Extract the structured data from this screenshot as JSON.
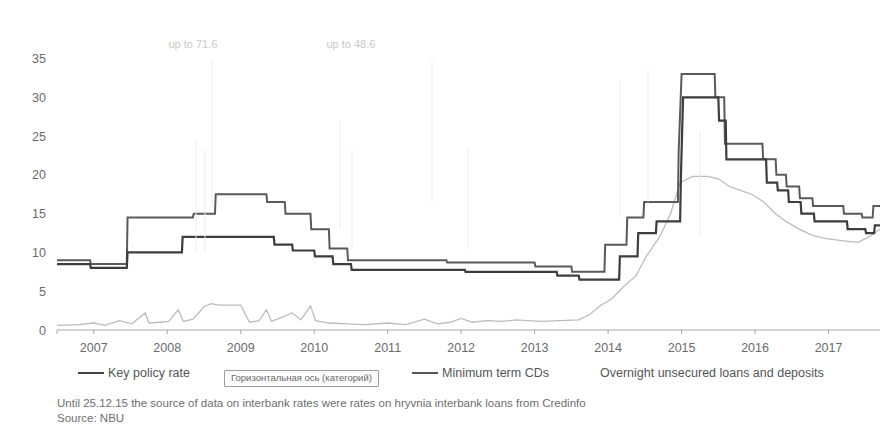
{
  "chart_data": {
    "type": "line",
    "title": "",
    "xlabel": "",
    "ylabel": "",
    "xlim": [
      2006.6,
      2017.8
    ],
    "ylim": [
      0,
      37
    ],
    "yticks": [
      0,
      5,
      10,
      15,
      20,
      25,
      30,
      35
    ],
    "xticks": [
      "2007",
      "2008",
      "2009",
      "2010",
      "2011",
      "2012",
      "2013",
      "2014",
      "2015",
      "2016",
      "2017"
    ],
    "grid": false,
    "legend_position": "bottom",
    "annotations": [
      {
        "text": "up to 71.6",
        "x": 2008.45,
        "y": 36.3
      },
      {
        "text": "up to 48.6",
        "x": 2010.6,
        "y": 36.3
      }
    ],
    "series": [
      {
        "name": "Key policy rate",
        "color": "#3d3d3d",
        "style": "step",
        "width": 2.2,
        "points": [
          [
            2006.6,
            8.5
          ],
          [
            2007.05,
            8.5
          ],
          [
            2007.06,
            8.0
          ],
          [
            2007.55,
            8.0
          ],
          [
            2007.56,
            10.0
          ],
          [
            2008.3,
            10.0
          ],
          [
            2008.31,
            12.0
          ],
          [
            2008.95,
            12.0
          ],
          [
            2008.96,
            12.0
          ],
          [
            2009.55,
            12.0
          ],
          [
            2009.56,
            11.0
          ],
          [
            2009.8,
            11.0
          ],
          [
            2009.81,
            10.25
          ],
          [
            2010.1,
            10.25
          ],
          [
            2010.11,
            9.5
          ],
          [
            2010.35,
            9.5
          ],
          [
            2010.36,
            8.5
          ],
          [
            2010.6,
            8.5
          ],
          [
            2010.61,
            7.75
          ],
          [
            2012.15,
            7.75
          ],
          [
            2012.16,
            7.5
          ],
          [
            2013.4,
            7.5
          ],
          [
            2013.41,
            7.0
          ],
          [
            2013.7,
            7.0
          ],
          [
            2013.71,
            6.5
          ],
          [
            2014.25,
            6.5
          ],
          [
            2014.26,
            9.5
          ],
          [
            2014.5,
            9.5
          ],
          [
            2014.51,
            12.5
          ],
          [
            2014.75,
            12.5
          ],
          [
            2014.76,
            14.0
          ],
          [
            2015.08,
            14.0
          ],
          [
            2015.09,
            19.5
          ],
          [
            2015.12,
            30.0
          ],
          [
            2015.6,
            30.0
          ],
          [
            2015.61,
            27.0
          ],
          [
            2015.7,
            27.0
          ],
          [
            2015.71,
            22.0
          ],
          [
            2016.25,
            22.0
          ],
          [
            2016.26,
            19.0
          ],
          [
            2016.4,
            19.0
          ],
          [
            2016.41,
            18.0
          ],
          [
            2016.55,
            18.0
          ],
          [
            2016.56,
            16.5
          ],
          [
            2016.72,
            16.5
          ],
          [
            2016.73,
            15.0
          ],
          [
            2016.9,
            15.0
          ],
          [
            2016.91,
            14.0
          ],
          [
            2017.35,
            14.0
          ],
          [
            2017.36,
            13.0
          ],
          [
            2017.6,
            13.0
          ],
          [
            2017.61,
            12.5
          ],
          [
            2017.72,
            12.5
          ],
          [
            2017.73,
            13.5
          ],
          [
            2017.8,
            13.5
          ]
        ]
      },
      {
        "name": "Minimum term CDs",
        "color": "#5a5a5a",
        "style": "step-upper",
        "width": 2.0,
        "points": [
          [
            2006.6,
            9.0
          ],
          [
            2007.05,
            9.0
          ],
          [
            2007.06,
            8.5
          ],
          [
            2007.55,
            8.5
          ],
          [
            2007.56,
            14.5
          ],
          [
            2008.45,
            14.5
          ],
          [
            2008.46,
            15.0
          ],
          [
            2008.75,
            15.0
          ],
          [
            2008.76,
            17.5
          ],
          [
            2009.45,
            17.5
          ],
          [
            2009.46,
            16.5
          ],
          [
            2009.7,
            16.5
          ],
          [
            2009.71,
            15.0
          ],
          [
            2010.05,
            15.0
          ],
          [
            2010.06,
            13.0
          ],
          [
            2010.3,
            13.0
          ],
          [
            2010.31,
            10.5
          ],
          [
            2010.55,
            10.5
          ],
          [
            2010.56,
            9.0
          ],
          [
            2011.9,
            9.0
          ],
          [
            2011.91,
            8.7
          ],
          [
            2013.1,
            8.7
          ],
          [
            2013.11,
            8.2
          ],
          [
            2013.6,
            8.2
          ],
          [
            2013.61,
            7.5
          ],
          [
            2014.05,
            7.5
          ],
          [
            2014.06,
            11.0
          ],
          [
            2014.35,
            11.0
          ],
          [
            2014.36,
            14.5
          ],
          [
            2014.58,
            14.5
          ],
          [
            2014.59,
            16.5
          ],
          [
            2015.05,
            16.5
          ],
          [
            2015.06,
            23.0
          ],
          [
            2015.1,
            33.0
          ],
          [
            2015.55,
            33.0
          ],
          [
            2015.56,
            30.0
          ],
          [
            2015.68,
            30.0
          ],
          [
            2015.69,
            24.0
          ],
          [
            2016.2,
            24.0
          ],
          [
            2016.21,
            22.0
          ],
          [
            2016.38,
            22.0
          ],
          [
            2016.39,
            20.0
          ],
          [
            2016.52,
            20.0
          ],
          [
            2016.53,
            18.5
          ],
          [
            2016.7,
            18.5
          ],
          [
            2016.71,
            17.0
          ],
          [
            2016.88,
            17.0
          ],
          [
            2016.89,
            16.0
          ],
          [
            2017.3,
            16.0
          ],
          [
            2017.31,
            15.0
          ],
          [
            2017.55,
            15.0
          ],
          [
            2017.56,
            14.5
          ],
          [
            2017.7,
            14.5
          ],
          [
            2017.71,
            16.0
          ],
          [
            2017.8,
            16.0
          ]
        ]
      },
      {
        "name": "Overnight unsecured loans and deposits",
        "color": "#bcbcbc",
        "style": "noisy",
        "width": 1.3,
        "points": [
          [
            2006.6,
            0.6
          ],
          [
            2006.9,
            0.7
          ],
          [
            2007.1,
            0.9
          ],
          [
            2007.25,
            0.6
          ],
          [
            2007.45,
            1.2
          ],
          [
            2007.62,
            0.8
          ],
          [
            2007.8,
            2.2
          ],
          [
            2007.85,
            0.9
          ],
          [
            2008.0,
            1.0
          ],
          [
            2008.12,
            1.1
          ],
          [
            2008.25,
            2.6
          ],
          [
            2008.32,
            1.1
          ],
          [
            2008.45,
            1.4
          ],
          [
            2008.6,
            3.0
          ],
          [
            2008.7,
            3.4
          ],
          [
            2008.8,
            3.2
          ],
          [
            2008.95,
            3.2
          ],
          [
            2009.1,
            3.2
          ],
          [
            2009.22,
            1.0
          ],
          [
            2009.35,
            1.2
          ],
          [
            2009.45,
            2.6
          ],
          [
            2009.52,
            1.1
          ],
          [
            2009.65,
            1.6
          ],
          [
            2009.8,
            2.2
          ],
          [
            2009.92,
            1.3
          ],
          [
            2010.05,
            3.1
          ],
          [
            2010.12,
            1.2
          ],
          [
            2010.3,
            0.9
          ],
          [
            2010.55,
            0.8
          ],
          [
            2010.8,
            0.7
          ],
          [
            2011.1,
            0.9
          ],
          [
            2011.35,
            0.7
          ],
          [
            2011.6,
            1.4
          ],
          [
            2011.78,
            0.8
          ],
          [
            2011.95,
            1.0
          ],
          [
            2012.1,
            1.5
          ],
          [
            2012.25,
            1.0
          ],
          [
            2012.45,
            1.2
          ],
          [
            2012.65,
            1.1
          ],
          [
            2012.85,
            1.3
          ],
          [
            2013.0,
            1.2
          ],
          [
            2013.2,
            1.1
          ],
          [
            2013.45,
            1.2
          ],
          [
            2013.7,
            1.3
          ],
          [
            2013.85,
            2.0
          ],
          [
            2014.0,
            3.2
          ],
          [
            2014.15,
            4.0
          ],
          [
            2014.3,
            5.5
          ],
          [
            2014.48,
            7.0
          ],
          [
            2014.62,
            9.5
          ],
          [
            2014.8,
            12.0
          ],
          [
            2014.95,
            15.0
          ],
          [
            2015.08,
            19.0
          ],
          [
            2015.25,
            19.8
          ],
          [
            2015.45,
            19.8
          ],
          [
            2015.6,
            19.5
          ],
          [
            2015.75,
            18.5
          ],
          [
            2015.9,
            18.0
          ],
          [
            2016.05,
            17.5
          ],
          [
            2016.22,
            16.5
          ],
          [
            2016.38,
            15.0
          ],
          [
            2016.52,
            14.0
          ],
          [
            2016.7,
            13.0
          ],
          [
            2016.88,
            12.2
          ],
          [
            2017.05,
            11.8
          ],
          [
            2017.3,
            11.5
          ],
          [
            2017.5,
            11.3
          ],
          [
            2017.65,
            12.0
          ],
          [
            2017.8,
            13.0
          ]
        ]
      }
    ]
  },
  "yaxis": {
    "labels": [
      "35",
      "30",
      "25",
      "20",
      "15",
      "10",
      "5",
      "0"
    ]
  },
  "xaxis": {
    "labels": [
      "2007",
      "2008",
      "2009",
      "2010",
      "2011",
      "2012",
      "2013",
      "2014",
      "2015",
      "2016",
      "2017"
    ]
  },
  "annotations": {
    "left": "up to 71.6",
    "right": "up to 48.6"
  },
  "legend": {
    "key_policy_rate": "Key policy rate",
    "minimum_term_cds": "Minimum term CDs",
    "overnight": "Overnight unsecured loans and deposits"
  },
  "tooltip": {
    "axis_label": "Горизонтальная ось (категорий)"
  },
  "footnotes": {
    "line1": "Until 25.12.15 the source of data on interbank rates were rates on hryvnia interbank loans from Credinfo",
    "line2": "Source: NBU"
  },
  "colors": {
    "key_policy_rate": "#3d3d3d",
    "minimum_term_cds": "#5a5a5a",
    "overnight": "#bcbcbc",
    "axis": "#a8a8a8",
    "text": "#6b6b6b"
  }
}
